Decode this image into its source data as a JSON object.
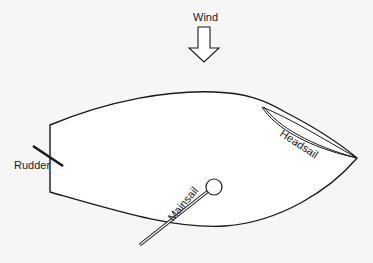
{
  "diagram": {
    "labels": {
      "wind": "Wind",
      "headsail": "Headsail",
      "mainsail": "Mainsail",
      "rudder": "Rudder"
    },
    "colors": {
      "stroke": "#1a1a1a",
      "hull_fill": "#ffffff",
      "background": "#f6f6f6"
    }
  }
}
